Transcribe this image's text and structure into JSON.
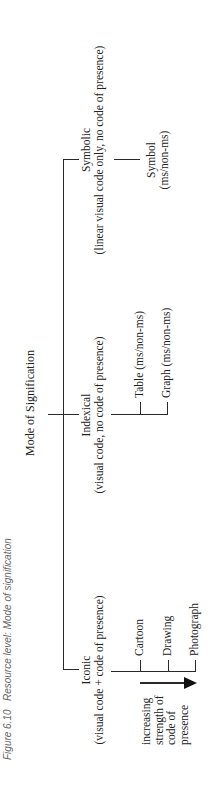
{
  "caption": {
    "figure_number": "Figure 6.10",
    "text": "Resource level: Mode of signification"
  },
  "diagram": {
    "title": "Mode of Signification",
    "branches": [
      {
        "label": "Iconic",
        "sublabel": "(visual code + code of presence)",
        "children": [
          "Cartoon",
          "Drawing",
          "Photograph"
        ],
        "axis_label": [
          "increasing",
          "strength of",
          "code of",
          "presence"
        ]
      },
      {
        "label": "Indexical",
        "sublabel": "(visual code, no code of presence)",
        "children": [
          "Table (ms/non-ms)",
          "Graph (ms/non-ms)"
        ]
      },
      {
        "label": "Symbolic",
        "sublabel": "(linear visual code only, no code of presence)",
        "children": [
          "Symbol",
          "(ms/non-ms)"
        ]
      }
    ]
  }
}
